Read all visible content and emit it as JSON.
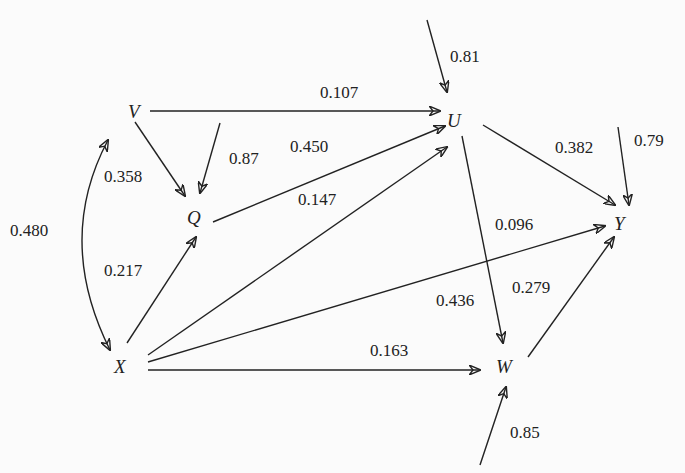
{
  "nodes": {
    "V": "V",
    "Q": "Q",
    "U": "U",
    "Y": "Y",
    "X": "X",
    "W": "W"
  },
  "edges": [
    {
      "from": "V",
      "to": "U",
      "coef": "0.107"
    },
    {
      "from": "V",
      "to": "Q",
      "coef": "0.358"
    },
    {
      "from": "Q",
      "to": "U",
      "coef": "0.450"
    },
    {
      "from": "X",
      "to": "U",
      "coef": "0.147"
    },
    {
      "from": "X",
      "to": "Q",
      "coef": "0.217"
    },
    {
      "from": "X",
      "to": "Y",
      "coef": "0.096"
    },
    {
      "from": "X",
      "to": "W",
      "coef": "0.163"
    },
    {
      "from": "U",
      "to": "Y",
      "coef": "0.382"
    },
    {
      "from": "U",
      "to": "W",
      "coef": "0.436"
    },
    {
      "from": "W",
      "to": "Y",
      "coef": "0.279"
    },
    {
      "from": "V",
      "to": "X",
      "coef": "0.480",
      "type": "correlation"
    }
  ],
  "residuals": {
    "U": "0.81",
    "Q": "0.87",
    "Y": "0.79",
    "W": "0.85"
  }
}
